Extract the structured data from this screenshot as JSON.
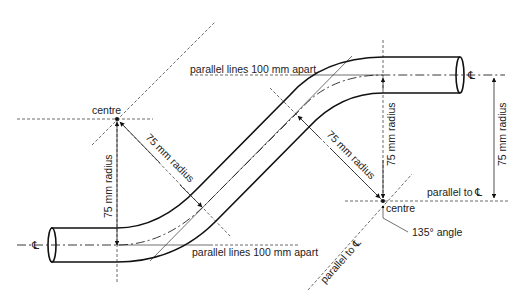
{
  "figure": {
    "labels": {
      "centre_left": "centre",
      "centre_right": "centre",
      "radius_left_vertical": "75 mm radius",
      "radius_left_diagonal": "75 mm radius",
      "radius_right_diagonal": "75 mm radius",
      "radius_right_vertical": "75 mm radius",
      "radius_right_dimension": "75 mm radius",
      "parallel_top": "parallel lines 100 mm apart",
      "parallel_bottom": "parallel lines 100 mm apart",
      "parallel_to_cl_horizontal": "parallel to ℄",
      "parallel_to_cl_diagonal": "parallel to ℄",
      "angle": "135° angle",
      "centreline_left": "℄",
      "centreline_right": "℄"
    },
    "colors": {
      "line": "#111111",
      "background": "#ffffff"
    }
  }
}
